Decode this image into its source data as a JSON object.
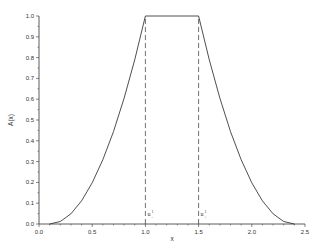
{
  "chart_data": {
    "type": "line",
    "title": "",
    "xlabel": "x",
    "ylabel": "A(x)",
    "xlim": [
      0.0,
      2.5
    ],
    "ylim": [
      0.0,
      1.0
    ],
    "grid": false,
    "legend": null,
    "x_ticks": [
      "0.0",
      "0.5",
      "1.0",
      "1.5",
      "2.0",
      "2.5"
    ],
    "y_ticks": [
      "0.0",
      "0.1",
      "0.2",
      "0.3",
      "0.4",
      "0.5",
      "0.6",
      "0.7",
      "0.8",
      "0.9",
      "1.0"
    ],
    "series": [
      {
        "name": "A(x)",
        "x": [
          0.1,
          0.2,
          0.3,
          0.4,
          0.5,
          0.6,
          0.7,
          0.8,
          0.9,
          1.0,
          1.5,
          1.6,
          1.7,
          1.8,
          1.9,
          2.0,
          2.1,
          2.2,
          2.3,
          2.4
        ],
        "y": [
          0.0,
          0.012,
          0.049,
          0.111,
          0.198,
          0.309,
          0.444,
          0.605,
          0.79,
          1.0,
          1.0,
          0.79,
          0.605,
          0.444,
          0.309,
          0.198,
          0.111,
          0.049,
          0.012,
          0.0
        ],
        "color": "#000000",
        "style": "solid"
      }
    ],
    "annotations": [
      {
        "type": "vline",
        "x": 1.0,
        "y_from": 0.0,
        "y_to": 1.0,
        "style": "dashed",
        "label": "u",
        "sup": "1",
        "sub": "-"
      },
      {
        "type": "vline",
        "x": 1.5,
        "y_from": 0.0,
        "y_to": 1.0,
        "style": "dashed",
        "label": "u",
        "sup": "1",
        "sub": "+"
      }
    ]
  }
}
